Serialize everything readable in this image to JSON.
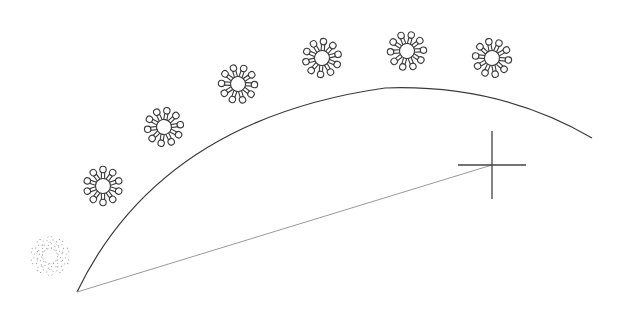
{
  "canvas": {
    "width": 621,
    "height": 311,
    "background": "#ffffff",
    "stroke_color": "#3a3a3a",
    "rubber_band_color": "#9a9a9a"
  },
  "arc": {
    "path": "M77,292 Q160,120 385,88 Q500,84 592,138"
  },
  "rubber_band_line": {
    "x1": 77,
    "y1": 292,
    "x2": 492,
    "y2": 165
  },
  "crosshair": {
    "cx": 492,
    "cy": 165,
    "half_width": 34,
    "half_height": 34
  },
  "icons": [
    {
      "name": "virus-icon",
      "cx": 103,
      "cy": 186,
      "rot": 0
    },
    {
      "name": "virus-icon",
      "cx": 164,
      "cy": 127,
      "rot": 10
    },
    {
      "name": "virus-icon",
      "cx": 238,
      "cy": 84,
      "rot": 20
    },
    {
      "name": "virus-icon",
      "cx": 322,
      "cy": 58,
      "rot": 5
    },
    {
      "name": "virus-icon",
      "cx": 407,
      "cy": 51,
      "rot": 15
    },
    {
      "name": "virus-icon",
      "cx": 492,
      "cy": 58,
      "rot": 25
    }
  ],
  "ghost_icon": {
    "name": "virus-ghost-icon",
    "cx": 50,
    "cy": 256
  }
}
